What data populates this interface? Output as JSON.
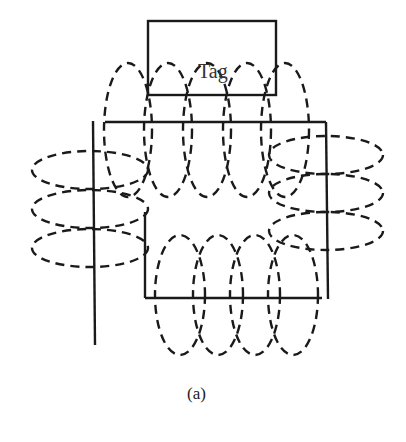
{
  "diagram": {
    "tag_label": "Tag",
    "caption": "(a)",
    "colors": {
      "line": "#1a1a1a",
      "background": "#ffffff"
    },
    "tag_box": {
      "x": 148,
      "y": 21,
      "w": 128,
      "h": 74
    },
    "reader_antenna": {
      "top_line": {
        "x1": 105,
        "y1": 122,
        "x2": 326,
        "y2": 122
      },
      "right_line": {
        "x1": 326,
        "y1": 122,
        "x2": 328,
        "y2": 299
      },
      "bottom_line": {
        "x1": 145,
        "y1": 298,
        "x2": 322,
        "y2": 298
      },
      "inner_left_line": {
        "x1": 145,
        "y1": 212,
        "x2": 145,
        "y2": 298
      },
      "left_vertical_line": {
        "x1": 93,
        "y1": 121,
        "x2": 95,
        "y2": 345
      }
    },
    "field_loops": {
      "top": [
        {
          "cx": 128,
          "cy": 130,
          "rx": 24,
          "ry": 67
        },
        {
          "cx": 168,
          "cy": 130,
          "rx": 24,
          "ry": 67
        },
        {
          "cx": 207,
          "cy": 130,
          "rx": 24,
          "ry": 67
        },
        {
          "cx": 247,
          "cy": 130,
          "rx": 24,
          "ry": 67
        },
        {
          "cx": 285,
          "cy": 130,
          "rx": 24,
          "ry": 67
        }
      ],
      "bottom": [
        {
          "cx": 180,
          "cy": 295,
          "rx": 25,
          "ry": 60
        },
        {
          "cx": 218,
          "cy": 295,
          "rx": 25,
          "ry": 60
        },
        {
          "cx": 255,
          "cy": 295,
          "rx": 25,
          "ry": 60
        },
        {
          "cx": 293,
          "cy": 295,
          "rx": 25,
          "ry": 60
        }
      ],
      "left": [
        {
          "cx": 90,
          "cy": 170,
          "rx": 58,
          "ry": 19
        },
        {
          "cx": 90,
          "cy": 209,
          "rx": 58,
          "ry": 19
        },
        {
          "cx": 90,
          "cy": 248,
          "rx": 58,
          "ry": 19
        }
      ],
      "right": [
        {
          "cx": 326,
          "cy": 155,
          "rx": 57,
          "ry": 19
        },
        {
          "cx": 326,
          "cy": 193,
          "rx": 57,
          "ry": 19
        },
        {
          "cx": 326,
          "cy": 231,
          "rx": 57,
          "ry": 19
        }
      ]
    }
  }
}
